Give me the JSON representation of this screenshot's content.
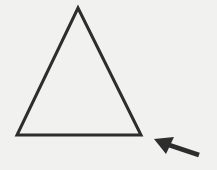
{
  "diagram": {
    "background": "#f1f1f0",
    "stroke_color": "#2d2d2d",
    "shapes": [
      {
        "type": "triangle",
        "points": [
          [
            78,
            8
          ],
          [
            17,
            135
          ],
          [
            141,
            135
          ]
        ],
        "fill": "none",
        "stroke_width": 3
      },
      {
        "type": "arrow",
        "direction": "up-left",
        "tip": [
          154,
          139
        ],
        "tail": [
          199,
          155
        ]
      }
    ]
  }
}
